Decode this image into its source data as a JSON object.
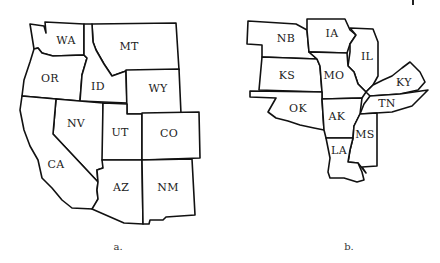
{
  "figure_a": {
    "caption": "a.",
    "states": [
      {
        "abbr": "WA",
        "x": 66,
        "y": 40
      },
      {
        "abbr": "OR",
        "x": 50,
        "y": 78
      },
      {
        "abbr": "MT",
        "x": 129,
        "y": 46
      },
      {
        "abbr": "ID",
        "x": 98,
        "y": 86
      },
      {
        "abbr": "WY",
        "x": 158,
        "y": 88
      },
      {
        "abbr": "NV",
        "x": 76,
        "y": 123
      },
      {
        "abbr": "UT",
        "x": 120,
        "y": 132
      },
      {
        "abbr": "CO",
        "x": 169,
        "y": 133
      },
      {
        "abbr": "CA",
        "x": 56,
        "y": 164
      },
      {
        "abbr": "AZ",
        "x": 121,
        "y": 187
      },
      {
        "abbr": "NM",
        "x": 168,
        "y": 187
      }
    ]
  },
  "figure_b": {
    "caption": "b.",
    "states": [
      {
        "abbr": "NB",
        "x": 286,
        "y": 38
      },
      {
        "abbr": "IA",
        "x": 332,
        "y": 33
      },
      {
        "abbr": "IL",
        "x": 367,
        "y": 56
      },
      {
        "abbr": "KS",
        "x": 287,
        "y": 75
      },
      {
        "abbr": "MO",
        "x": 334,
        "y": 75
      },
      {
        "abbr": "KY",
        "x": 404,
        "y": 82
      },
      {
        "abbr": "OK",
        "x": 298,
        "y": 108
      },
      {
        "abbr": "TN",
        "x": 387,
        "y": 103
      },
      {
        "abbr": "AK",
        "x": 337,
        "y": 116
      },
      {
        "abbr": "MS",
        "x": 365,
        "y": 134
      },
      {
        "abbr": "LA",
        "x": 339,
        "y": 150
      }
    ]
  }
}
